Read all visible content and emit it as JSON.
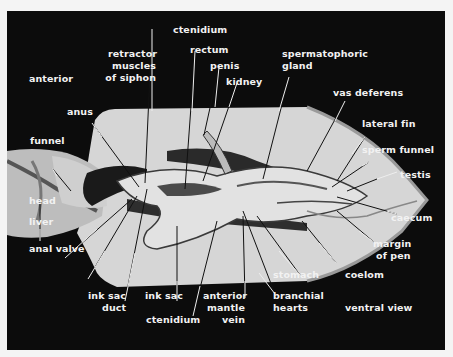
{
  "figure": {
    "background": "#0c0c0c",
    "label_color": "#f2f2f2",
    "view": "ventral view",
    "orientation": "anterior",
    "labels": {
      "ctenidium_top": "ctenidium",
      "retractor_1": "retractor",
      "retractor_2": "muscles",
      "retractor_3": "of siphon",
      "rectum": "rectum",
      "penis": "penis",
      "kidney": "kidney",
      "spermatophoric_1": "spermatophoric",
      "spermatophoric_2": "gland",
      "anterior": "anterior",
      "anus": "anus",
      "vas_deferens": "vas deferens",
      "lateral_fin": "lateral fin",
      "sperm_funnel": "sperm funnel",
      "funnel": "funnel",
      "testis": "testis",
      "head": "head",
      "caecum": "caecum",
      "liver": "liver",
      "margin_1": "margin",
      "margin_2": "of pen",
      "anal_valve": "anal valve",
      "coelom": "coelom",
      "stomach": "stomach",
      "ink_sac_duct_1": "ink sac",
      "ink_sac_duct_2": "duct",
      "ink_sac": "ink sac",
      "anterior_mantle_1": "anterior",
      "anterior_mantle_2": "mantle",
      "anterior_mantle_3": "vein",
      "branchial_1": "branchial",
      "branchial_2": "hearts",
      "ctenidium_bottom": "ctenidium",
      "ventral_view": "ventral view"
    }
  }
}
